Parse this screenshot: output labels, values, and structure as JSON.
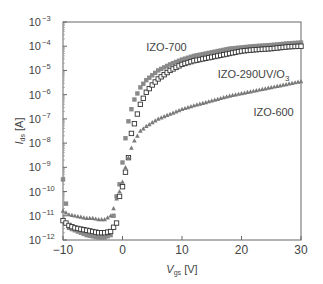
{
  "chart_data": {
    "type": "scatter",
    "title": "",
    "xlabel": "V_gs [V]",
    "xlabel_main": "V",
    "xlabel_sub": "gs",
    "xlabel_unit": "[V]",
    "ylabel": "I_ds [A]",
    "ylabel_main": "I",
    "ylabel_sub": "ds",
    "ylabel_unit": "[A]",
    "xlim": [
      -10,
      30
    ],
    "ylim_log10": [
      -12,
      -3
    ],
    "yscale": "log",
    "grid": false,
    "legend_position": "inline labels",
    "x_ticks": [
      -10,
      0,
      10,
      20,
      30
    ],
    "x_tick_labels": [
      "−10",
      "0",
      "10",
      "20",
      "30"
    ],
    "y_ticks_log10": [
      -12,
      -11,
      -10,
      -9,
      -8,
      -7,
      -6,
      -5,
      -4,
      -3
    ],
    "y_tick_labels": [
      "10",
      "10",
      "10",
      "10",
      "10",
      "10",
      "10",
      "10",
      "10",
      "10"
    ],
    "y_tick_exponents": [
      "−12",
      "−11",
      "−10",
      "−9",
      "−8",
      "−7",
      "−6",
      "−5",
      "−4",
      "−3"
    ],
    "series": [
      {
        "name": "IZO-700",
        "label_main": "IZO-700",
        "label_sub": "",
        "marker": "filled-square",
        "color": "#8a8a8a",
        "x": [
          -10,
          -9,
          -8,
          -7,
          -6,
          -5,
          -4,
          -3,
          -2,
          -1,
          -0.5,
          0,
          0.5,
          1,
          1.5,
          2,
          3,
          4,
          5,
          6,
          8,
          10,
          12,
          15,
          18,
          20,
          22,
          25,
          28,
          30
        ],
        "log10_y": [
          -9.5,
          -11.5,
          -11.6,
          -11.7,
          -11.8,
          -11.85,
          -11.9,
          -11.9,
          -11.8,
          -10.2,
          -9.7,
          -8.8,
          -7.8,
          -7.1,
          -6.6,
          -6.2,
          -5.7,
          -5.4,
          -5.2,
          -5.0,
          -4.75,
          -4.55,
          -4.4,
          -4.25,
          -4.1,
          -4.05,
          -4.0,
          -3.95,
          -3.88,
          -3.85
        ]
      },
      {
        "name": "IZO-290UV/O3",
        "label_main": "IZO-290UV/O",
        "label_sub": "3",
        "marker": "open-square",
        "color": "#333333",
        "x": [
          -10,
          -9,
          -8,
          -7,
          -6,
          -5,
          -4,
          -3,
          -2,
          -1,
          -0.5,
          0,
          0.5,
          1,
          1.5,
          2,
          3,
          4,
          5,
          6,
          8,
          10,
          12,
          15,
          18,
          20,
          22,
          25,
          28,
          30
        ],
        "log10_y": [
          -11.2,
          -11.4,
          -11.5,
          -11.55,
          -11.6,
          -11.65,
          -11.7,
          -11.7,
          -11.65,
          -11.3,
          -10.2,
          -9.8,
          -9.2,
          -8.6,
          -7.6,
          -7.2,
          -6.4,
          -5.9,
          -5.6,
          -5.35,
          -5.0,
          -4.75,
          -4.6,
          -4.45,
          -4.3,
          -4.2,
          -4.15,
          -4.1,
          -4.02,
          -4.0
        ]
      },
      {
        "name": "IZO-600",
        "label_main": "IZO-600",
        "label_sub": "",
        "marker": "filled-triangle",
        "color": "#7a7a7a",
        "x": [
          -10,
          -9,
          -8,
          -7,
          -6,
          -5,
          -4,
          -3,
          -2,
          -1.5,
          -1,
          -0.5,
          0,
          0.5,
          1,
          1.5,
          2,
          3,
          4,
          5,
          6,
          8,
          10,
          12,
          15,
          18,
          20,
          22,
          25,
          28,
          30
        ],
        "log10_y": [
          -10.8,
          -10.95,
          -11.0,
          -11.05,
          -11.1,
          -11.1,
          -11.15,
          -11.15,
          -11.0,
          -10.7,
          -10.3,
          -10.0,
          -9.6,
          -9.0,
          -8.6,
          -8.2,
          -7.9,
          -7.5,
          -7.3,
          -7.15,
          -7.0,
          -6.8,
          -6.6,
          -6.45,
          -6.25,
          -6.05,
          -5.95,
          -5.85,
          -5.7,
          -5.55,
          -5.45
        ]
      }
    ],
    "annotations": [
      {
        "text": "IZO-700",
        "x": 4,
        "log10_y": -4.2
      },
      {
        "text": "IZO-290UV/O3",
        "x": 16,
        "log10_y": -5.3
      },
      {
        "text": "IZO-600",
        "x": 22,
        "log10_y": -6.9
      }
    ]
  }
}
